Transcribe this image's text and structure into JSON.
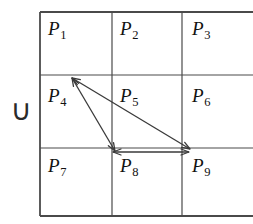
{
  "figure": {
    "background_color": "#ffffff",
    "line_color": "#4a4a4a",
    "arrow_color": "#3a3a3a",
    "text_color": "#111111"
  },
  "union_symbol": {
    "glyph": "∪",
    "name": "union-symbol"
  },
  "grid": {
    "left": 40,
    "top": 12,
    "right": 253,
    "bottom": 216,
    "vertical_lines": [
      40,
      112,
      182
    ],
    "horizontal_lines": [
      12,
      75,
      148,
      216
    ],
    "columns": 3,
    "rows": 3
  },
  "cells": [
    {
      "id": "P1",
      "base": "P",
      "sub": "1",
      "x": 48,
      "y": 18,
      "row": 1,
      "col": 1
    },
    {
      "id": "P2",
      "base": "P",
      "sub": "2",
      "x": 120,
      "y": 18,
      "row": 1,
      "col": 2
    },
    {
      "id": "P3",
      "base": "P",
      "sub": "3",
      "x": 192,
      "y": 18,
      "row": 1,
      "col": 3
    },
    {
      "id": "P4",
      "base": "P",
      "sub": "4",
      "x": 48,
      "y": 85,
      "row": 2,
      "col": 1
    },
    {
      "id": "P5",
      "base": "P",
      "sub": "5",
      "x": 120,
      "y": 85,
      "row": 2,
      "col": 2
    },
    {
      "id": "P6",
      "base": "P",
      "sub": "6",
      "x": 192,
      "y": 85,
      "row": 2,
      "col": 3
    },
    {
      "id": "P7",
      "base": "P",
      "sub": "7",
      "x": 48,
      "y": 155,
      "row": 3,
      "col": 1
    },
    {
      "id": "P8",
      "base": "P",
      "sub": "8",
      "x": 120,
      "y": 155,
      "row": 3,
      "col": 2
    },
    {
      "id": "P9",
      "base": "P",
      "sub": "9",
      "x": 192,
      "y": 155,
      "row": 3,
      "col": 3
    }
  ],
  "arrows": [
    {
      "name": "arrow-p4-p8",
      "from": {
        "x": 72,
        "y": 78
      },
      "to": {
        "x": 115,
        "y": 151
      },
      "double_headed": true
    },
    {
      "name": "arrow-p4-p9",
      "from": {
        "x": 72,
        "y": 78
      },
      "to": {
        "x": 190,
        "y": 149
      },
      "double_headed": true
    },
    {
      "name": "arrow-p8-p9",
      "from": {
        "x": 113,
        "y": 152
      },
      "to": {
        "x": 189,
        "y": 152
      },
      "double_headed": true
    }
  ]
}
